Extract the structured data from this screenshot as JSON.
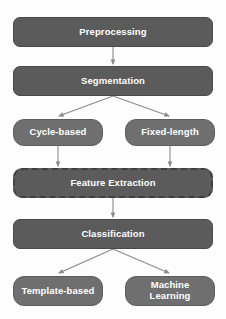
{
  "diagram": {
    "background_color": "#fdfdfd",
    "node_dark_color": "#5b5b5b",
    "node_light_color": "#6f6f6f",
    "edge_color": "#8a8a8a",
    "text_color": "#ffffff",
    "nodes": [
      {
        "id": "preprocessing",
        "label": "Preprocessing",
        "style": "dark",
        "x": 13,
        "y": 17,
        "w": 200,
        "h": 30
      },
      {
        "id": "segmentation",
        "label": "Segmentation",
        "style": "dark",
        "x": 13,
        "y": 66,
        "w": 200,
        "h": 30
      },
      {
        "id": "cycle-based",
        "label": "Cycle-based",
        "style": "light",
        "x": 13,
        "y": 119,
        "w": 90,
        "h": 27
      },
      {
        "id": "fixed-length",
        "label": "Fixed-length",
        "style": "light",
        "x": 125,
        "y": 119,
        "w": 90,
        "h": 27
      },
      {
        "id": "feature-extraction",
        "label": "Feature Extraction",
        "style": "dashed",
        "x": 13,
        "y": 168,
        "w": 200,
        "h": 30
      },
      {
        "id": "classification",
        "label": "Classification",
        "style": "dark",
        "x": 13,
        "y": 219,
        "w": 200,
        "h": 30
      },
      {
        "id": "template-based",
        "label": "Template-based",
        "style": "light",
        "x": 13,
        "y": 276,
        "w": 90,
        "h": 30
      },
      {
        "id": "machine-learning",
        "label": "Machine\nLearning",
        "style": "light",
        "x": 125,
        "y": 276,
        "w": 90,
        "h": 30
      }
    ],
    "edges": [
      {
        "from": "preprocessing",
        "to": "segmentation",
        "kind": "straight"
      },
      {
        "from": "segmentation",
        "to": "cycle-based",
        "kind": "branch-left"
      },
      {
        "from": "segmentation",
        "to": "fixed-length",
        "kind": "branch-right"
      },
      {
        "from": "cycle-based",
        "to": "feature-extraction",
        "kind": "straight"
      },
      {
        "from": "fixed-length",
        "to": "feature-extraction",
        "kind": "straight"
      },
      {
        "from": "feature-extraction",
        "to": "classification",
        "kind": "straight"
      },
      {
        "from": "classification",
        "to": "template-based",
        "kind": "branch-left"
      },
      {
        "from": "classification",
        "to": "machine-learning",
        "kind": "branch-right"
      }
    ]
  }
}
